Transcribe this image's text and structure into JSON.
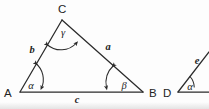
{
  "figure": {
    "kind": "geometry-diagram",
    "stroke_color": "#2b2b2b",
    "background_color": "#ffffff",
    "width": 209,
    "height": 109
  },
  "triangle": {
    "name": "triangle-ABC",
    "vertices": [
      {
        "id": "A",
        "label": "A",
        "x": 20,
        "y": 92
      },
      {
        "id": "B",
        "label": "B",
        "x": 143,
        "y": 92
      },
      {
        "id": "C",
        "label": "C",
        "x": 62,
        "y": 20
      }
    ],
    "vertex_labels": {
      "A": "A",
      "B": "B",
      "C": "C"
    },
    "sides": [
      {
        "id": "a",
        "label": "a",
        "between": "C-B",
        "label_x": 107,
        "label_y": 50
      },
      {
        "id": "b",
        "label": "b",
        "between": "A-C",
        "label_x": 32,
        "label_y": 50
      },
      {
        "id": "c",
        "label": "c",
        "between": "A-B",
        "label_x": 77,
        "label_y": 103
      }
    ],
    "angles": [
      {
        "id": "alpha",
        "label": "α",
        "at_vertex": "A",
        "label_x": 31,
        "label_y": 88
      },
      {
        "id": "beta",
        "label": "β",
        "at_vertex": "B",
        "label_x": 123,
        "label_y": 88
      },
      {
        "id": "gamma",
        "label": "γ",
        "at_vertex": "C",
        "label_x": 63,
        "label_y": 35
      }
    ]
  },
  "partial_figure": {
    "name": "partial-triangle-D",
    "cropped": "right edge",
    "vertices": [
      {
        "id": "D",
        "label": "D",
        "x": 178,
        "y": 92
      }
    ],
    "vertex_labels": {
      "D": "D"
    },
    "sides": [
      {
        "id": "e",
        "label": "e",
        "label_x": 197,
        "label_y": 62
      }
    ],
    "angles": [
      {
        "id": "alpha2",
        "label": "α",
        "at_vertex": "D",
        "label_x": 190,
        "label_y": 89
      }
    ]
  }
}
